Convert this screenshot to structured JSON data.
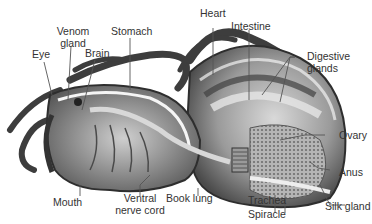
{
  "diagram": {
    "colors": {
      "background": "#ffffff",
      "label_text": "#333333",
      "leader_line": "#555555",
      "body_dark": "#3a3a3a",
      "body_mid": "#7a7a7a",
      "body_light": "#c8c8c8"
    },
    "labels": {
      "venom_gland_1": "Venom",
      "venom_gland_2": "gland",
      "stomach": "Stomach",
      "eye": "Eye",
      "brain": "Brain",
      "heart": "Heart",
      "intestine": "Intestine",
      "digestive_glands_1": "Digestive",
      "digestive_glands_2": "glands",
      "ovary": "Ovary",
      "anus": "Anus",
      "mouth": "Mouth",
      "ventral_nerve_cord_1": "Ventral",
      "ventral_nerve_cord_2": "nerve cord",
      "book_lung": "Book lung",
      "trachea": "Trachea",
      "spiracle": "Spiracle",
      "silk_gland": "Silk gland"
    }
  }
}
